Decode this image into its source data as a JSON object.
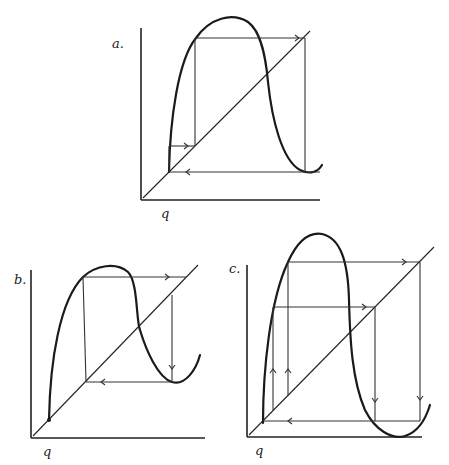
{
  "figure": {
    "panels": [
      {
        "id": "a",
        "label": "a.",
        "axis_label": "q",
        "notes": "Trajectory converges to a period-2 cycle between low point and high point"
      },
      {
        "id": "b",
        "label": "b.",
        "axis_label": "q",
        "notes": "Trajectory from near-zero start climbs to peak then falls and returns"
      },
      {
        "id": "c",
        "label": "c.",
        "axis_label": "q",
        "notes": "Steep hump with two nested cobweb loops"
      }
    ]
  },
  "colors": {
    "ink": "#222222",
    "background": "#ffffff"
  }
}
